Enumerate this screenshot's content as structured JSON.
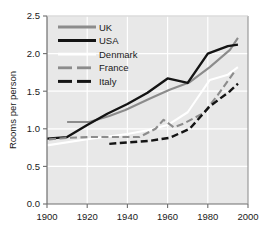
{
  "chart_data": {
    "type": "line",
    "title": "",
    "xlabel": "",
    "ylabel": "Rooms per person",
    "xlim": [
      1900,
      2000
    ],
    "ylim": [
      0.0,
      2.5
    ],
    "xticks": [
      "1900",
      "1920",
      "1940",
      "1960",
      "1980",
      "2000"
    ],
    "xtick_values": [
      1900,
      1920,
      1940,
      1960,
      1980,
      2000
    ],
    "yticks": [
      "0.0",
      "0.5",
      "1.0",
      "1.5",
      "2.0",
      "2.5"
    ],
    "ytick_values": [
      0.0,
      0.5,
      1.0,
      1.5,
      2.0,
      2.5
    ],
    "grid": true,
    "grid_color": "#ffffff",
    "plot_background": "#e8e8e8",
    "legend_position": "upper-left",
    "series": [
      {
        "name": "UK",
        "color": "#8c8c8c",
        "style": "solid",
        "x": [
          1910,
          1921,
          1931,
          1939,
          1951,
          1961,
          1971,
          1981,
          1991,
          1995
        ],
        "y": [
          1.09,
          1.09,
          1.17,
          1.25,
          1.4,
          1.52,
          1.62,
          1.82,
          2.05,
          2.21
        ]
      },
      {
        "name": "USA",
        "color": "#141414",
        "style": "solid",
        "x": [
          1900,
          1910,
          1920,
          1930,
          1940,
          1950,
          1960,
          1970,
          1980,
          1990,
          1995
        ],
        "y": [
          0.87,
          0.89,
          1.05,
          1.2,
          1.33,
          1.48,
          1.67,
          1.61,
          2.0,
          2.1,
          2.12
        ]
      },
      {
        "name": "Denmark",
        "color": "#ffffff",
        "style": "solid",
        "x": [
          1900,
          1920,
          1940,
          1950,
          1960,
          1970,
          1981,
          1990,
          1995
        ],
        "y": [
          0.78,
          0.86,
          0.93,
          0.98,
          1.05,
          1.22,
          1.65,
          1.72,
          1.82
        ]
      },
      {
        "name": "France",
        "color": "#8c8c8c",
        "style": "dashed",
        "x": [
          1901,
          1911,
          1921,
          1931,
          1946,
          1954,
          1958,
          1963,
          1968,
          1978,
          1985,
          1993
        ],
        "y": [
          0.86,
          0.88,
          0.89,
          0.89,
          0.89,
          1.0,
          1.12,
          1.02,
          1.07,
          1.21,
          1.45,
          1.75
        ]
      },
      {
        "name": "Italy",
        "color": "#141414",
        "style": "dashed",
        "x": [
          1931,
          1951,
          1961,
          1971,
          1981,
          1991,
          1995
        ],
        "y": [
          0.8,
          0.84,
          0.88,
          1.0,
          1.3,
          1.5,
          1.6
        ]
      }
    ]
  },
  "legend": {
    "items": [
      {
        "label": "UK",
        "color": "#8c8c8c",
        "style": "solid"
      },
      {
        "label": "USA",
        "color": "#141414",
        "style": "solid"
      },
      {
        "label": "Denmark",
        "color": "#ffffff",
        "style": "solid"
      },
      {
        "label": "France",
        "color": "#8c8c8c",
        "style": "dashed"
      },
      {
        "label": "Italy",
        "color": "#141414",
        "style": "dashed"
      }
    ]
  }
}
